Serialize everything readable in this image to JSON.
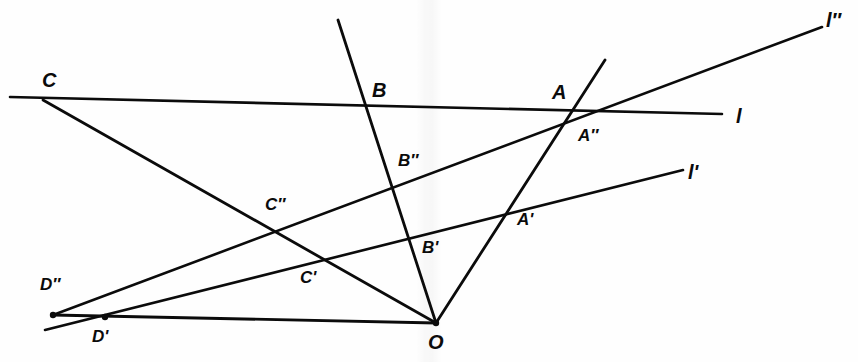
{
  "figure": {
    "background_color": "#fefefe",
    "ink_color": "#0b0b0b",
    "width": 858,
    "height": 362
  },
  "line_labels": {
    "l": {
      "text": "l",
      "x": 736,
      "y": 106
    },
    "lp": {
      "text": "l'",
      "x": 688,
      "y": 162
    },
    "lpp": {
      "text": "l″",
      "x": 826,
      "y": 10
    }
  },
  "point_labels": [
    {
      "id": "C",
      "text": "C",
      "x": 42,
      "y": 70,
      "size": "big"
    },
    {
      "id": "B",
      "text": "B",
      "x": 372,
      "y": 80,
      "size": "big"
    },
    {
      "id": "A",
      "text": "A",
      "x": 552,
      "y": 82,
      "size": "big"
    },
    {
      "id": "App",
      "text": "A″",
      "x": 578,
      "y": 127,
      "size": "mid"
    },
    {
      "id": "Bpp",
      "text": "B″",
      "x": 398,
      "y": 152,
      "size": "mid"
    },
    {
      "id": "Cpp",
      "text": "C″",
      "x": 265,
      "y": 196,
      "size": "mid"
    },
    {
      "id": "Ap",
      "text": "A'",
      "x": 517,
      "y": 211,
      "size": "mid"
    },
    {
      "id": "Bp",
      "text": "B'",
      "x": 422,
      "y": 239,
      "size": "mid"
    },
    {
      "id": "Cp",
      "text": "C'",
      "x": 300,
      "y": 269,
      "size": "mid"
    },
    {
      "id": "Dpp",
      "text": "D″",
      "x": 40,
      "y": 276,
      "size": "mid"
    },
    {
      "id": "Dp",
      "text": "D'",
      "x": 92,
      "y": 328,
      "size": "mid"
    },
    {
      "id": "O",
      "text": "O",
      "x": 428,
      "y": 332,
      "size": "big"
    }
  ],
  "points": {
    "O": {
      "x": 436,
      "y": 323,
      "dot": true
    },
    "A": {
      "x": 573,
      "y": 114,
      "dot": false
    },
    "B": {
      "x": 368,
      "y": 107,
      "dot": false
    },
    "C": {
      "x": 43,
      "y": 100,
      "dot": false
    },
    "Ap": {
      "x": 508,
      "y": 213,
      "dot": false
    },
    "Bp": {
      "x": 409,
      "y": 238,
      "dot": false
    },
    "Cp": {
      "x": 322,
      "y": 261,
      "dot": false
    },
    "Dp": {
      "x": 105,
      "y": 317,
      "dot": true
    },
    "App": {
      "x": 592,
      "y": 117,
      "dot": false
    },
    "Bpp": {
      "x": 393,
      "y": 188,
      "dot": false
    },
    "Cpp": {
      "x": 275,
      "y": 233,
      "dot": false
    },
    "Dpp": {
      "x": 53,
      "y": 315,
      "dot": true
    }
  },
  "segments": [
    {
      "name": "line-l",
      "x1": 10,
      "y1": 97,
      "x2": 722,
      "y2": 114,
      "w": 2.6
    },
    {
      "name": "line-l-prime",
      "x1": 45,
      "y1": 330,
      "x2": 683,
      "y2": 170,
      "w": 2.6
    },
    {
      "name": "line-l-double-prime",
      "x1": 53,
      "y1": 315,
      "x2": 822,
      "y2": 27,
      "w": 2.6
    },
    {
      "name": "ray-O-A",
      "x1": 436,
      "y1": 323,
      "x2": 605,
      "y2": 60,
      "w": 2.8
    },
    {
      "name": "ray-O-B",
      "x1": 436,
      "y1": 323,
      "x2": 338,
      "y2": 20,
      "w": 2.8
    },
    {
      "name": "ray-O-C",
      "x1": 436,
      "y1": 323,
      "x2": 43,
      "y2": 100,
      "w": 2.8
    },
    {
      "name": "ray-O-D",
      "x1": 436,
      "y1": 323,
      "x2": 53,
      "y2": 315,
      "w": 2.8
    }
  ],
  "chart_data": {
    "type": "diagram",
    "center": "O",
    "lines": [
      {
        "label": "l",
        "points_on_line": [
          "C",
          "B",
          "A"
        ]
      },
      {
        "label": "l'",
        "points_on_line": [
          "D'",
          "C'",
          "B'",
          "A'"
        ]
      },
      {
        "label": "l″",
        "points_on_line": [
          "D″",
          "C″",
          "B″",
          "A″"
        ]
      }
    ],
    "rays_from_center": [
      {
        "through": [
          "A",
          "A'",
          "A″"
        ]
      },
      {
        "through": [
          "B",
          "B'",
          "B″"
        ]
      },
      {
        "through": [
          "C",
          "C'",
          "C″"
        ]
      },
      {
        "through": [
          "D'",
          "D″"
        ]
      }
    ]
  }
}
